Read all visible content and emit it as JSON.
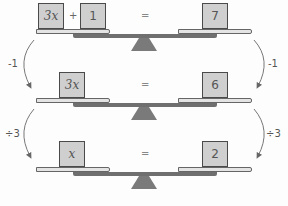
{
  "rows": [
    {
      "left": [
        "3x",
        "1"
      ],
      "operator": "+",
      "equals": "=",
      "right": "7"
    },
    {
      "left": [
        "3x"
      ],
      "equals": "=",
      "right": "6"
    },
    {
      "left": [
        "x"
      ],
      "equals": "=",
      "right": "2"
    }
  ],
  "steps": [
    {
      "left_label": "-1",
      "right_label": "-1"
    },
    {
      "left_label": "÷3",
      "right_label": "÷3"
    }
  ],
  "colors": {
    "box_fill": "#cfcfcf",
    "pan_fill": "#e4e4e4",
    "beam": "#6f6f6f",
    "fulcrum": "#7a7a7a",
    "arrow": "#666666"
  }
}
